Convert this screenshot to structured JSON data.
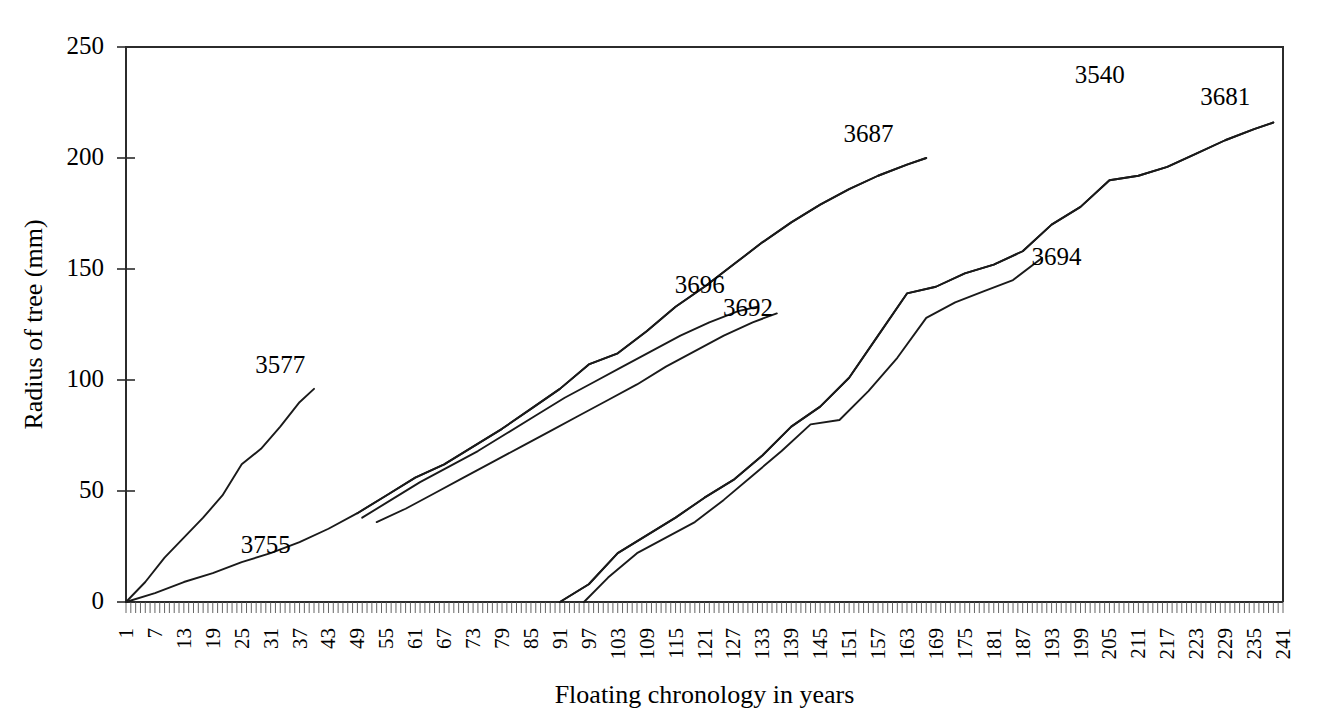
{
  "chart_data": {
    "type": "line",
    "title": "",
    "xlabel": "Floating chronology in years",
    "ylabel": "Radius of tree (mm)",
    "xlim": [
      1,
      241
    ],
    "ylim": [
      0,
      250
    ],
    "grid": false,
    "legend_position": "inline-end-of-line-labels",
    "y_ticks": [
      0,
      50,
      100,
      150,
      200,
      250
    ],
    "x_ticks": [
      1,
      7,
      13,
      19,
      25,
      31,
      37,
      43,
      49,
      55,
      61,
      67,
      73,
      79,
      85,
      91,
      97,
      103,
      109,
      115,
      121,
      127,
      133,
      139,
      145,
      151,
      157,
      163,
      169,
      175,
      181,
      187,
      193,
      199,
      205,
      211,
      217,
      223,
      229,
      235,
      241
    ],
    "x_minor_tick_step": 1,
    "line_color": "#1a1a1a",
    "series": [
      {
        "name": "3577",
        "label": "3577",
        "label_x": 33,
        "label_y": 103,
        "x": [
          1,
          5,
          9,
          13,
          17,
          21,
          25,
          29,
          33,
          37,
          40
        ],
        "values": [
          0,
          9,
          20,
          29,
          38,
          48,
          62,
          69,
          79,
          90,
          96
        ]
      },
      {
        "name": "3755",
        "label": "3755",
        "label_x": 30,
        "label_y": 22,
        "x": [
          1,
          7,
          13,
          19,
          25,
          31,
          37,
          43,
          49,
          55,
          61,
          67,
          73,
          79,
          85,
          91,
          97,
          103,
          109,
          115,
          121,
          127,
          133,
          139,
          145,
          151,
          157,
          163,
          167
        ],
        "values": [
          0,
          4,
          9,
          13,
          18,
          22,
          27,
          33,
          40,
          48,
          56,
          62,
          70,
          78,
          87,
          96,
          107,
          112,
          122,
          133,
          142,
          152,
          162,
          171,
          179,
          186,
          192,
          197,
          200
        ]
      },
      {
        "name": "3687",
        "label": "3687",
        "label_x": 155,
        "label_y": 207,
        "x": [
          49,
          55,
          61,
          67,
          73,
          79,
          85,
          91,
          97,
          103,
          109,
          115,
          121,
          127,
          133,
          139,
          145,
          151,
          157,
          163,
          167
        ],
        "values": [
          40,
          48,
          56,
          62,
          70,
          78,
          87,
          96,
          107,
          112,
          122,
          133,
          142,
          152,
          162,
          171,
          179,
          186,
          192,
          197,
          200
        ]
      },
      {
        "name": "3696",
        "label": "3696",
        "label_x": 120,
        "label_y": 139,
        "x": [
          50,
          56,
          62,
          68,
          74,
          80,
          86,
          92,
          98,
          104,
          110,
          116,
          122,
          128,
          132
        ],
        "values": [
          38,
          46,
          54,
          61,
          68,
          76,
          84,
          92,
          99,
          106,
          113,
          120,
          126,
          131,
          133
        ]
      },
      {
        "name": "3692",
        "label": "3692",
        "label_x": 130,
        "label_y": 129,
        "x": [
          53,
          59,
          65,
          71,
          77,
          83,
          89,
          95,
          101,
          107,
          113,
          119,
          125,
          131,
          136
        ],
        "values": [
          36,
          42,
          49,
          56,
          63,
          70,
          77,
          84,
          91,
          98,
          106,
          113,
          120,
          126,
          130
        ]
      },
      {
        "name": "3540",
        "label": "3540",
        "label_x": 203,
        "label_y": 234,
        "x": [
          91,
          97,
          103,
          109,
          115,
          121,
          127,
          133,
          139,
          145,
          151,
          157,
          163,
          169,
          175,
          181,
          187,
          193,
          199,
          205,
          211,
          217,
          223,
          229,
          235,
          239
        ],
        "values": [
          0,
          8,
          22,
          30,
          38,
          47,
          55,
          66,
          79,
          88,
          101,
          120,
          139,
          142,
          148,
          152,
          158,
          170,
          178,
          190,
          192,
          196,
          202,
          208,
          213,
          216
        ]
      },
      {
        "name": "3681",
        "label": "3681",
        "label_x": 229,
        "label_y": 224,
        "x": [
          91,
          97,
          103,
          109,
          115,
          121,
          127,
          133,
          139,
          145,
          151,
          157,
          163,
          169,
          175,
          181,
          187,
          193,
          199,
          205,
          211,
          217,
          223,
          229,
          235,
          239
        ],
        "values": [
          0,
          8,
          22,
          30,
          38,
          47,
          55,
          66,
          79,
          88,
          101,
          120,
          139,
          142,
          148,
          152,
          158,
          170,
          178,
          190,
          192,
          196,
          202,
          208,
          213,
          216
        ]
      },
      {
        "name": "3694",
        "label": "3694",
        "label_x": 194,
        "label_y": 152,
        "x": [
          96,
          101,
          107,
          113,
          119,
          125,
          131,
          137,
          143,
          149,
          155,
          161,
          167,
          173,
          179,
          185,
          191
        ],
        "values": [
          0,
          11,
          22,
          29,
          36,
          46,
          57,
          68,
          80,
          82,
          95,
          110,
          128,
          135,
          140,
          145,
          155
        ]
      }
    ]
  },
  "axes": {
    "y_title": "Radius of tree (mm)",
    "x_title": "Floating chronology in years",
    "y_tick_labels": [
      "0",
      "50",
      "100",
      "150",
      "200",
      "250"
    ],
    "x_tick_labels": [
      "1",
      "7",
      "13",
      "19",
      "25",
      "31",
      "37",
      "43",
      "49",
      "55",
      "61",
      "67",
      "73",
      "79",
      "85",
      "91",
      "97",
      "103",
      "109",
      "115",
      "121",
      "127",
      "133",
      "139",
      "145",
      "151",
      "157",
      "163",
      "169",
      "175",
      "181",
      "187",
      "193",
      "199",
      "205",
      "211",
      "217",
      "223",
      "229",
      "235",
      "241"
    ]
  },
  "series_labels": [
    "3577",
    "3755",
    "3687",
    "3696",
    "3692",
    "3540",
    "3681",
    "3694"
  ],
  "colors": {
    "line": "#1a1a1a",
    "axis": "#2b2b2b",
    "background": "#ffffff"
  }
}
